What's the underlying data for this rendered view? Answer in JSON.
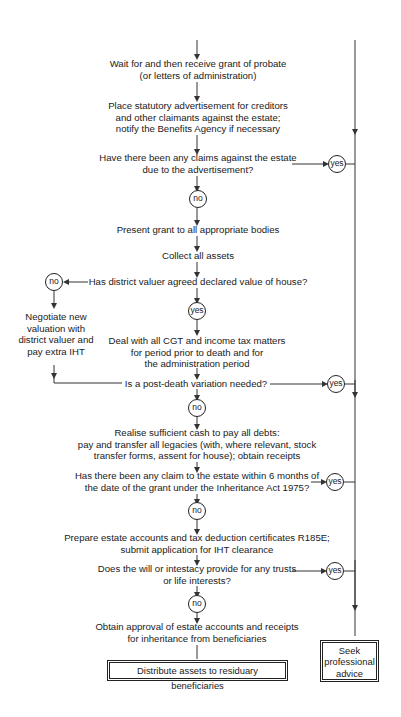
{
  "flowchart": {
    "steps": [
      {
        "id": "receive-grant",
        "lines": [
          "Wait for and then receive grant of probate",
          "(or letters of administration)"
        ]
      },
      {
        "id": "statutory-advert",
        "lines": [
          "Place statutory advertisement for creditors",
          "and other claimants against the estate;",
          "notify the Benefits Agency if necessary"
        ]
      },
      {
        "id": "claims-question",
        "lines": [
          "Have there been any claims against the estate",
          "due to the advertisement?"
        ]
      },
      {
        "id": "present-grant",
        "lines": [
          "Present grant to all appropriate bodies"
        ]
      },
      {
        "id": "collect-assets",
        "lines": [
          "Collect all assets"
        ]
      },
      {
        "id": "valuer-question",
        "lines": [
          "Has district valuer agreed declared value of house?"
        ]
      },
      {
        "id": "cgt-matters",
        "lines": [
          "Deal with all CGT and income tax matters",
          "for period prior to death and for",
          "the administration period"
        ]
      },
      {
        "id": "variation-question",
        "lines": [
          "Is a post-death variation needed?"
        ]
      },
      {
        "id": "realise-cash",
        "lines": [
          "Realise sufficient cash to pay all debts:",
          "pay and transfer all legacies (with, where relevant, stock",
          "transfer forms, assent for house); obtain receipts"
        ]
      },
      {
        "id": "inheritance-act-question",
        "lines": [
          "Has there been any claim to the estate within 6 months of",
          "the date of the grant under the Inheritance Act 1975?"
        ]
      },
      {
        "id": "prepare-accounts",
        "lines": [
          "Prepare estate accounts and tax deduction certificates R185E;",
          "submit application for IHT clearance"
        ]
      },
      {
        "id": "trusts-question",
        "lines": [
          "Does the will or intestacy provide for any trusts",
          "or life interests?"
        ]
      },
      {
        "id": "obtain-approval",
        "lines": [
          "Obtain approval of estate accounts and receipts",
          "for inheritance from beneficiaries"
        ]
      }
    ],
    "side_branch": {
      "lines": [
        "Negotiate new",
        "valuation with",
        "district valuer and",
        "pay extra IHT"
      ]
    },
    "answers": {
      "yes": "yes",
      "no": "no"
    },
    "end_main": "Distribute assets to residuary beneficiaries",
    "end_side": [
      "Seek",
      "professional",
      "advice"
    ]
  }
}
